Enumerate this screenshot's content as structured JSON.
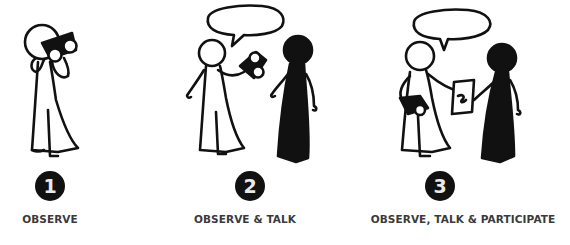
{
  "steps": [
    {
      "number": "1",
      "label": "OBSERVE",
      "figures": [
        "observer-with-binoculars"
      ]
    },
    {
      "number": "2",
      "label": "OBSERVE & TALK",
      "figures": [
        "observer-with-binoculars-speaking",
        "dark-person"
      ]
    },
    {
      "number": "3",
      "label": "OBSERVE, TALK & PARTICIPATE",
      "figures": [
        "observer-holding-binoculars-and-paper",
        "dark-person"
      ]
    }
  ],
  "colors": {
    "ink": "#111111",
    "badge_text": "#e8e8e8",
    "label": "#3a3a3a",
    "background": "#ffffff"
  }
}
